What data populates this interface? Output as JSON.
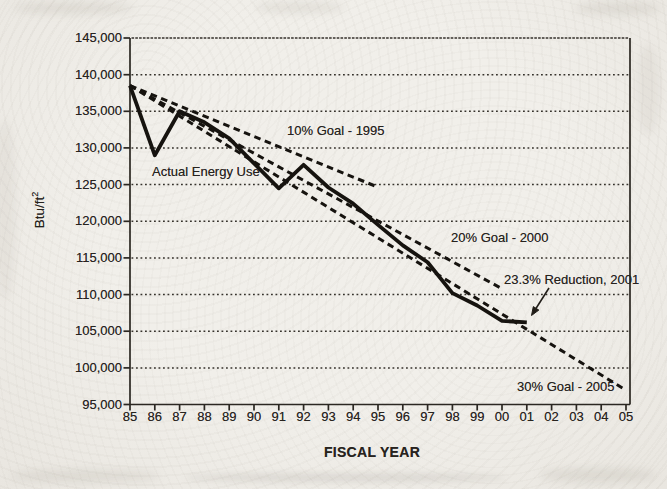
{
  "page": {
    "background_color": "#f0eee9",
    "ink_color": "#1c1915"
  },
  "chart_data": {
    "type": "line",
    "title": "",
    "xlabel": "FISCAL YEAR",
    "ylabel": "Btu/ft",
    "ylabel_superscript": "2",
    "grid": "dotted-horizontal",
    "legend": "none (labels annotated on plot)",
    "ylim": [
      95000,
      145000
    ],
    "xlim_years": [
      1985,
      2005.2
    ],
    "y_ticks": [
      {
        "value": 145000,
        "label": "145,000"
      },
      {
        "value": 140000,
        "label": "140,000"
      },
      {
        "value": 135000,
        "label": "135,000"
      },
      {
        "value": 130000,
        "label": "130,000"
      },
      {
        "value": 125000,
        "label": "125,000"
      },
      {
        "value": 120000,
        "label": "120,000"
      },
      {
        "value": 115000,
        "label": "115,000"
      },
      {
        "value": 110000,
        "label": "110,000"
      },
      {
        "value": 105000,
        "label": "105,000"
      },
      {
        "value": 100000,
        "label": "100,000"
      },
      {
        "value": 95000,
        "label": "95,000"
      }
    ],
    "x_ticks": [
      {
        "year": 1985,
        "label": "85"
      },
      {
        "year": 1986,
        "label": "86"
      },
      {
        "year": 1987,
        "label": "87"
      },
      {
        "year": 1988,
        "label": "88"
      },
      {
        "year": 1989,
        "label": "89"
      },
      {
        "year": 1990,
        "label": "90"
      },
      {
        "year": 1991,
        "label": "91"
      },
      {
        "year": 1992,
        "label": "92"
      },
      {
        "year": 1993,
        "label": "93"
      },
      {
        "year": 1994,
        "label": "94"
      },
      {
        "year": 1995,
        "label": "95"
      },
      {
        "year": 1996,
        "label": "96"
      },
      {
        "year": 1997,
        "label": "97"
      },
      {
        "year": 1998,
        "label": "98"
      },
      {
        "year": 1999,
        "label": "99"
      },
      {
        "year": 2000,
        "label": "00"
      },
      {
        "year": 2001,
        "label": "01"
      },
      {
        "year": 2002,
        "label": "02"
      },
      {
        "year": 2003,
        "label": "03"
      },
      {
        "year": 2004,
        "label": "04"
      },
      {
        "year": 2005,
        "label": "05"
      }
    ],
    "series": [
      {
        "name": "Actual Energy Use",
        "style": "solid",
        "years": [
          1985,
          1986,
          1987,
          1988,
          1989,
          1990,
          1991,
          1992,
          1993,
          1994,
          1995,
          1996,
          1997,
          1998,
          1999,
          2000,
          2001
        ],
        "values": [
          138500,
          129000,
          135000,
          133500,
          131300,
          127900,
          124500,
          127700,
          124600,
          122400,
          119500,
          116700,
          114400,
          110200,
          108500,
          106400,
          106200
        ]
      },
      {
        "name": "10% Goal - 1995",
        "style": "dashed",
        "years": [
          1985,
          1995
        ],
        "values": [
          138500,
          124650
        ]
      },
      {
        "name": "20% Goal - 2000",
        "style": "dashed",
        "years": [
          1985,
          2000
        ],
        "values": [
          138500,
          110800
        ]
      },
      {
        "name": "30% Goal - 2005",
        "style": "dashed",
        "years": [
          1985,
          2005
        ],
        "values": [
          138500,
          96950
        ]
      }
    ],
    "annotations": [
      {
        "id": "actual-energy-use-label",
        "text": "Actual Energy Use",
        "left": 152,
        "top": 165
      },
      {
        "id": "goal-10-label",
        "text": "10% Goal - 1995",
        "left": 287,
        "top": 124
      },
      {
        "id": "goal-20-label",
        "text": "20% Goal - 2000",
        "left": 451,
        "top": 231
      },
      {
        "id": "reduction-label",
        "text": "23.3% Reduction, 2001",
        "left": 504,
        "top": 273
      },
      {
        "id": "goal-30-label",
        "text": "30% Goal - 2005",
        "left": 517,
        "top": 380
      }
    ],
    "arrow": {
      "x1": 549,
      "y1": 288,
      "x2": 531.5,
      "y2": 315.5
    }
  }
}
